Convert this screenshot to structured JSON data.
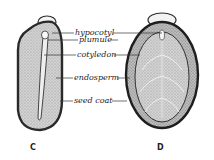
{
  "diagram": {
    "figures": [
      {
        "id": "C",
        "label": "C",
        "view": "longitudinal section"
      },
      {
        "id": "D",
        "label": "D",
        "view": "face view"
      }
    ],
    "labels": [
      {
        "text": "hypocotyl",
        "y": 34
      },
      {
        "text": "plumule",
        "y": 41
      },
      {
        "text": "cotyledon",
        "y": 56
      },
      {
        "text": "endosperm",
        "y": 76
      },
      {
        "text": "seed coat",
        "y": 101
      }
    ],
    "colors": {
      "outline": "#2a2a2a",
      "endosperm": "#c9c9c9",
      "cotyledon": "#b5b5b5",
      "seed_coat": "#9a9a9a",
      "leader_line": "#333333"
    }
  }
}
